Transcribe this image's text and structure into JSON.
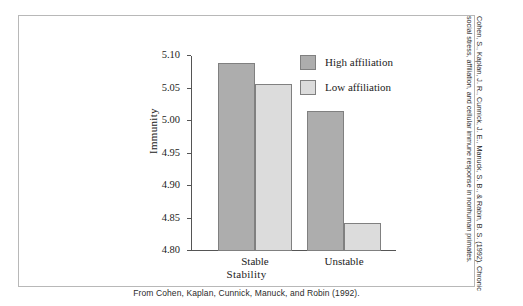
{
  "figure": {
    "source_caption": "From Cohen, Kaplan, Cunnick, Manuck, and Robin (1992).",
    "side_credit_line1": "Cohen, S., Kaplan, J. R., Cunnick, J. E., Manuck, S. B., & Rabin, B. S. (1992). Chronic",
    "side_credit_line2": "social stress, affiliation, and cellular immune response in nonhuman primates."
  },
  "legend": {
    "items": [
      {
        "label": "High affiliation",
        "color": "#adadad"
      },
      {
        "label": "Low affiliation",
        "color": "#dcdcdc"
      }
    ]
  },
  "chart_data": {
    "type": "bar",
    "title": "",
    "xlabel": "Stability",
    "ylabel": "Immunity",
    "categories": [
      "Stable",
      "Unstable"
    ],
    "series": [
      {
        "name": "High affiliation",
        "color": "#adadad",
        "values": [
          5.089,
          5.016
        ]
      },
      {
        "name": "Low affiliation",
        "color": "#dcdcdc",
        "values": [
          5.057,
          4.843
        ]
      }
    ],
    "ylim": [
      4.8,
      5.1
    ],
    "yticks": [
      "4.80",
      "4.85",
      "4.90",
      "4.95",
      "5.00",
      "5.05",
      "5.10"
    ],
    "ytick_values": [
      4.8,
      4.85,
      4.9,
      4.95,
      5.0,
      5.05,
      5.1
    ],
    "grid": false,
    "legend_position": "top-right"
  }
}
